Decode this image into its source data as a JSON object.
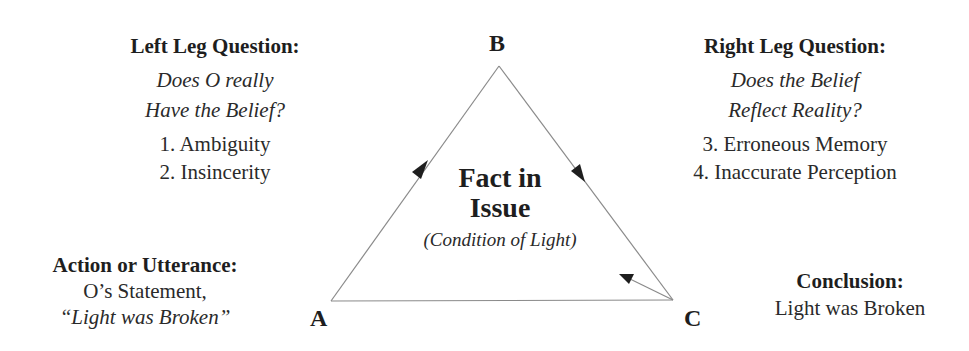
{
  "vertices": {
    "a": "A",
    "b": "B",
    "c": "C"
  },
  "left_leg": {
    "heading": "Left Leg Question:",
    "question_line1": "Does O really",
    "question_line2": "Have the Belief?",
    "items": [
      "1. Ambiguity",
      "2. Insincerity"
    ]
  },
  "right_leg": {
    "heading": "Right Leg Question:",
    "question_line1": "Does the Belief",
    "question_line2": "Reflect Reality?",
    "items": [
      "3. Erroneous Memory",
      "4. Inaccurate Perception"
    ]
  },
  "center": {
    "title_line1": "Fact in",
    "title_line2": "Issue",
    "subtitle": "(Condition of Light)"
  },
  "action": {
    "heading": "Action or Utterance:",
    "line1": "O’s Statement,",
    "line2": "“Light was Broken”"
  },
  "conclusion": {
    "heading": "Conclusion:",
    "line1": "Light was Broken"
  },
  "colors": {
    "line": "#8a8a8a",
    "arrow": "#1e1e1e",
    "text": "#222222"
  }
}
